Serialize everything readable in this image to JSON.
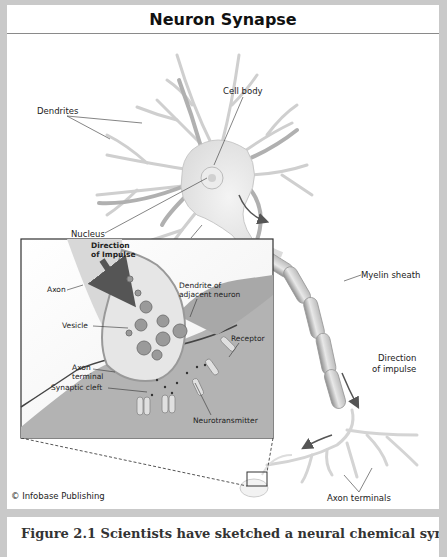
{
  "title": "Neuron Synapse",
  "credit": "© Infobase Publishing",
  "caption": "Figure 2.1   Scientists have sketched a neural chemical synapse ... (cut off)",
  "labels": {
    "dendrites": "Dendrites",
    "cell_body": "Cell body",
    "nucleus": "Nucleus",
    "axon_main": "Axon",
    "myelin_sheath": "Myelin sheath",
    "direction_impulse_1": "Direction",
    "direction_impulse_2": "of impulse",
    "axon_terminals": "Axon terminals"
  },
  "inset": {
    "direction_1": "Direction",
    "direction_2": "of Impulse",
    "axon": "Axon",
    "dendrite_1": "Dendrite of",
    "dendrite_2": "adjacent neuron",
    "vesicle": "Vesicle",
    "receptor": "Receptor",
    "axon_terminal_1": "Axon",
    "axon_terminal_2": "terminal",
    "synaptic_cleft": "Synaptic cleft",
    "neurotransmitter": "Neurotransmitter"
  },
  "colors": {
    "frame": "#c9c9c9",
    "neuron_fill": "#e6e6e6",
    "neuron_stroke": "#b5b5b5",
    "arrow": "#555555",
    "inset_dark": "#9a9a9a"
  }
}
